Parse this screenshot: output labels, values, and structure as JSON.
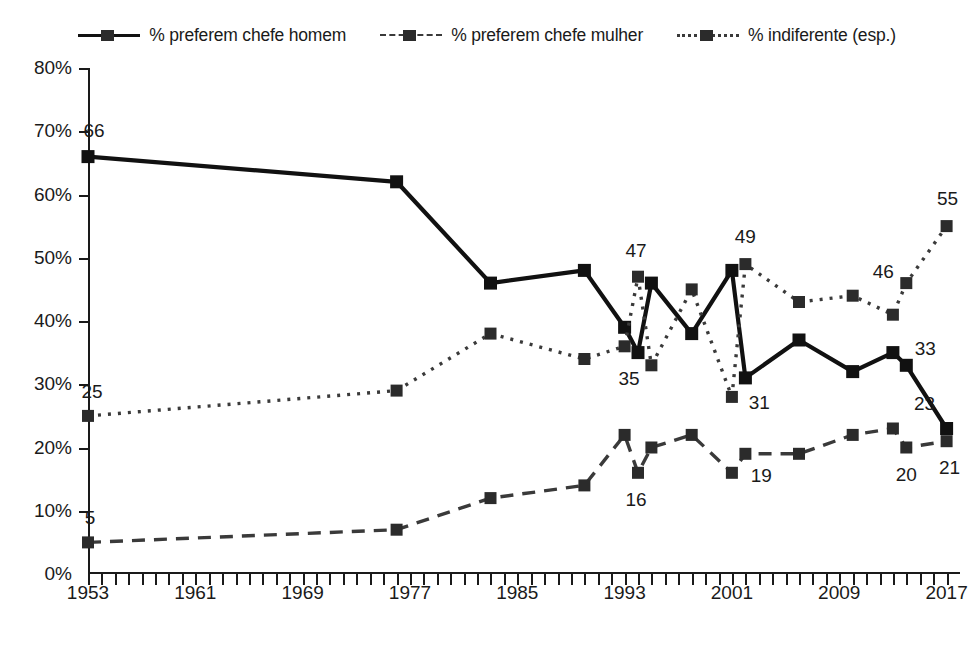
{
  "legend": {
    "items": [
      {
        "label": "% preferem chefe homem",
        "key": "solid-square-key",
        "style": "solid"
      },
      {
        "label": "% preferem chefe mulher",
        "key": "dashed-square-key",
        "style": "dashed"
      },
      {
        "label": "% indiferente (esp.)",
        "key": "dotted-square-key",
        "style": "dotted"
      }
    ]
  },
  "axes": {
    "y_ticks": [
      "0%",
      "10%",
      "20%",
      "30%",
      "40%",
      "50%",
      "60%",
      "70%",
      "80%"
    ],
    "x_ticks": [
      "1953",
      "1961",
      "1969",
      "1977",
      "1985",
      "1993",
      "2001",
      "2009",
      "2017"
    ]
  },
  "chart_data": {
    "type": "line",
    "title": "",
    "xlabel": "",
    "ylabel": "",
    "ylim": [
      0,
      80
    ],
    "xlim": [
      1953,
      2018
    ],
    "grid": false,
    "legend_position": "top-center",
    "x_tick_values": [
      1953,
      1961,
      1969,
      1977,
      1985,
      1993,
      2001,
      2009,
      2017
    ],
    "y_tick_values": [
      0,
      10,
      20,
      30,
      40,
      50,
      60,
      70,
      80
    ],
    "series": [
      {
        "name": "% preferem chefe homem",
        "style": "solid",
        "marker": "square",
        "color": "#111111",
        "points": [
          {
            "x": 1953,
            "y": 66
          },
          {
            "x": 1976,
            "y": 62
          },
          {
            "x": 1983,
            "y": 46
          },
          {
            "x": 1990,
            "y": 48
          },
          {
            "x": 1993,
            "y": 39
          },
          {
            "x": 1994,
            "y": 35
          },
          {
            "x": 1995,
            "y": 46
          },
          {
            "x": 1998,
            "y": 38
          },
          {
            "x": 2001,
            "y": 48
          },
          {
            "x": 2002,
            "y": 31
          },
          {
            "x": 2006,
            "y": 37
          },
          {
            "x": 2010,
            "y": 32
          },
          {
            "x": 2013,
            "y": 35
          },
          {
            "x": 2014,
            "y": 33
          },
          {
            "x": 2017,
            "y": 23
          }
        ]
      },
      {
        "name": "% preferem chefe mulher",
        "style": "dashed",
        "marker": "square",
        "color": "#3a3a3a",
        "points": [
          {
            "x": 1953,
            "y": 5
          },
          {
            "x": 1976,
            "y": 7
          },
          {
            "x": 1983,
            "y": 12
          },
          {
            "x": 1990,
            "y": 14
          },
          {
            "x": 1993,
            "y": 22
          },
          {
            "x": 1994,
            "y": 16
          },
          {
            "x": 1995,
            "y": 20
          },
          {
            "x": 1998,
            "y": 22
          },
          {
            "x": 2001,
            "y": 16
          },
          {
            "x": 2002,
            "y": 19
          },
          {
            "x": 2006,
            "y": 19
          },
          {
            "x": 2010,
            "y": 22
          },
          {
            "x": 2013,
            "y": 23
          },
          {
            "x": 2014,
            "y": 20
          },
          {
            "x": 2017,
            "y": 21
          }
        ]
      },
      {
        "name": "% indiferente (esp.)",
        "style": "dotted",
        "marker": "square",
        "color": "#3a3a3a",
        "points": [
          {
            "x": 1953,
            "y": 25
          },
          {
            "x": 1976,
            "y": 29
          },
          {
            "x": 1983,
            "y": 38
          },
          {
            "x": 1990,
            "y": 34
          },
          {
            "x": 1993,
            "y": 36
          },
          {
            "x": 1994,
            "y": 47
          },
          {
            "x": 1995,
            "y": 33
          },
          {
            "x": 1998,
            "y": 45
          },
          {
            "x": 2001,
            "y": 28
          },
          {
            "x": 2002,
            "y": 49
          },
          {
            "x": 2006,
            "y": 43
          },
          {
            "x": 2010,
            "y": 44
          },
          {
            "x": 2013,
            "y": 41
          },
          {
            "x": 2014,
            "y": 46
          },
          {
            "x": 2017,
            "y": 55
          }
        ]
      }
    ],
    "annotations": [
      {
        "text": "66",
        "x": 1953,
        "y": 66,
        "dx": 6,
        "dy": -26
      },
      {
        "text": "25",
        "x": 1953,
        "y": 25,
        "dx": 4,
        "dy": -24
      },
      {
        "text": "5",
        "x": 1953,
        "y": 5,
        "dx": 2,
        "dy": -24
      },
      {
        "text": "47",
        "x": 1994,
        "y": 47,
        "dx": -2,
        "dy": -26
      },
      {
        "text": "35",
        "x": 1994,
        "y": 35,
        "dx": -9,
        "dy": 26
      },
      {
        "text": "49",
        "x": 2002,
        "y": 49,
        "dx": 0,
        "dy": -27
      },
      {
        "text": "31",
        "x": 2002,
        "y": 31,
        "dx": 14,
        "dy": 25
      },
      {
        "text": "16",
        "x": 1994,
        "y": 16,
        "dx": -2,
        "dy": 27
      },
      {
        "text": "19",
        "x": 2002,
        "y": 19,
        "dx": 16,
        "dy": 22
      },
      {
        "text": "46",
        "x": 2014,
        "y": 46,
        "dx": -23,
        "dy": -11
      },
      {
        "text": "33",
        "x": 2014,
        "y": 33,
        "dx": 19,
        "dy": -16
      },
      {
        "text": "55",
        "x": 2017,
        "y": 55,
        "dx": 1,
        "dy": -27
      },
      {
        "text": "20",
        "x": 2014,
        "y": 20,
        "dx": 0,
        "dy": 27
      },
      {
        "text": "21",
        "x": 2017,
        "y": 21,
        "dx": 3,
        "dy": 27
      },
      {
        "text": "23",
        "x": 2017,
        "y": 23,
        "dx": -22,
        "dy": -25
      }
    ]
  }
}
